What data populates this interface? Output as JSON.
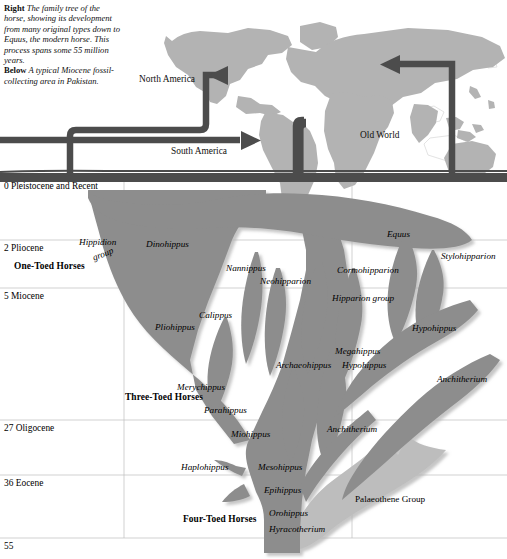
{
  "caption": {
    "right_tag": "Right",
    "right_text": "The family tree of the horse, showing its development from many original types down to Equus, the modern horse. This process spans some 55 million years.",
    "below_tag": "Below",
    "below_text": "A typical Miocene fossil-collecting area in Pakistan."
  },
  "map": {
    "labels": [
      {
        "name": "north-america",
        "text": "North America",
        "x": 139,
        "y": 74
      },
      {
        "name": "south-america",
        "text": "South America",
        "x": 171,
        "y": 146
      },
      {
        "name": "old-world",
        "text": "Old World",
        "x": 360,
        "y": 130
      }
    ]
  },
  "timescale": {
    "unit_note": "millions of years",
    "rows": [
      {
        "value": "0",
        "epoch": "Pleistocene and Recent",
        "y": 178
      },
      {
        "value": "2",
        "epoch": "Pliocene",
        "y": 240
      },
      {
        "value": "5",
        "epoch": "Miocene",
        "y": 288
      },
      {
        "value": "27",
        "epoch": "Oligocene",
        "y": 420
      },
      {
        "value": "36",
        "epoch": "Eocene",
        "y": 475
      },
      {
        "value": "55",
        "epoch": "",
        "y": 538
      }
    ]
  },
  "groups": [
    {
      "name": "one-toed-horses",
      "text": "One-Toed Horses",
      "x": 14,
      "y": 261
    },
    {
      "name": "three-toed-horses",
      "text": "Three-Toed Horses",
      "x": 125,
      "y": 392
    },
    {
      "name": "four-toed-horses",
      "text": "Four-Toed Horses",
      "x": 183,
      "y": 514
    }
  ],
  "taxa": [
    {
      "name": "hippidion-group-line1",
      "text": "Hippidion",
      "x": 79,
      "y": 237,
      "italic": true
    },
    {
      "name": "hippidion-group-line2",
      "text": "group",
      "x": 92,
      "y": 249,
      "italic": true,
      "rotate": -22
    },
    {
      "name": "dinohippus",
      "text": "Dinohippus",
      "x": 146,
      "y": 239
    },
    {
      "name": "equus",
      "text": "Equus",
      "x": 387,
      "y": 229
    },
    {
      "name": "stylohipparion",
      "text": "Stylohipparion",
      "x": 441,
      "y": 251
    },
    {
      "name": "nannippus",
      "text": "Nannippus",
      "x": 226,
      "y": 263
    },
    {
      "name": "neohipparion",
      "text": "Neohipparion",
      "x": 260,
      "y": 276
    },
    {
      "name": "cormohipparion",
      "text": "Cormohipparion",
      "x": 337,
      "y": 265
    },
    {
      "name": "hipparion-group",
      "text": "Hipparion group",
      "x": 332,
      "y": 293
    },
    {
      "name": "calippus",
      "text": "Calippus",
      "x": 199,
      "y": 310
    },
    {
      "name": "pliohippus",
      "text": "Pliohippus",
      "x": 155,
      "y": 322
    },
    {
      "name": "hypohippus-upper",
      "text": "Hypohippus",
      "x": 412,
      "y": 323
    },
    {
      "name": "megahippus",
      "text": "Megahippus",
      "x": 335,
      "y": 346
    },
    {
      "name": "archaeohippus",
      "text": "Archaeohippus",
      "x": 276,
      "y": 360
    },
    {
      "name": "hypohippus-lower",
      "text": "Hypohippus",
      "x": 342,
      "y": 360
    },
    {
      "name": "anchitherium-upper",
      "text": "Anchitherium",
      "x": 437,
      "y": 374
    },
    {
      "name": "merychippus",
      "text": "Merychippus",
      "x": 177,
      "y": 382
    },
    {
      "name": "parahippus",
      "text": "Parahippus",
      "x": 204,
      "y": 405
    },
    {
      "name": "anchitherium-lower",
      "text": "Anchitherium",
      "x": 327,
      "y": 424
    },
    {
      "name": "miohippus",
      "text": "Miohippus",
      "x": 231,
      "y": 429
    },
    {
      "name": "haplohippus",
      "text": "Haplohippus",
      "x": 181,
      "y": 462
    },
    {
      "name": "mesohippus",
      "text": "Mesohippus",
      "x": 258,
      "y": 462
    },
    {
      "name": "epihippus",
      "text": "Epihippus",
      "x": 264,
      "y": 485
    },
    {
      "name": "palaeothene-group",
      "text": "Palaeothene Group",
      "x": 355,
      "y": 494,
      "italic": false
    },
    {
      "name": "orohippus",
      "text": "Orohippus",
      "x": 269,
      "y": 508
    },
    {
      "name": "hyracotherium",
      "text": "Hyracotherium",
      "x": 269,
      "y": 524
    }
  ],
  "colors": {
    "tree_fill": "#8d8d8d",
    "tree_light_fill": "#bdbdbd",
    "map_land": "#b3b3b3",
    "map_outline": "#d8d8d8",
    "pipe": "#4c4c4c",
    "gridline": "#b8b8b8",
    "background": "#ffffff"
  }
}
